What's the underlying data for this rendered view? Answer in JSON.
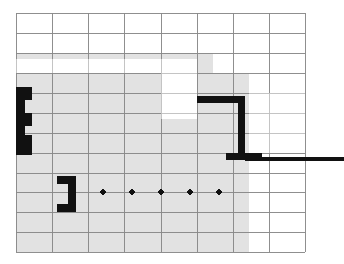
{
  "figure": {
    "name": "floor-plan-grid-diagram",
    "canvas": {
      "width": 344,
      "height": 264,
      "background": "#ffffff"
    }
  },
  "grid": {
    "name": "structural-grid",
    "origin_x": 16,
    "origin_y": 13,
    "cell_width": 36.2,
    "cell_height": 19.9,
    "columns": 8,
    "rows": 12,
    "line_color": "#8a8a8a",
    "line_width": 0.9,
    "x_lines": [
      16,
      52,
      88,
      124,
      161,
      197,
      233,
      269,
      305
    ],
    "y_lines": [
      13,
      33,
      53,
      73,
      93,
      113,
      133,
      153,
      173,
      192,
      212,
      232,
      252
    ]
  },
  "slab": {
    "name": "concrete-slab-fill",
    "fill": "#e2e2e2",
    "regions": [
      {
        "name": "slab-upper-band",
        "x": 16,
        "y": 53,
        "width": 197,
        "height": 20
      },
      {
        "name": "slab-main-body",
        "x": 16,
        "y": 73,
        "width": 233,
        "height": 179
      }
    ]
  },
  "voids": {
    "name": "floor-openings",
    "fill": "#ffffff",
    "regions": [
      {
        "name": "void-upper-left-corridor",
        "x": 16,
        "y": 59,
        "width": 181,
        "height": 14
      },
      {
        "name": "void-central-shaft",
        "x": 161,
        "y": 67,
        "width": 36,
        "height": 52
      },
      {
        "name": "void-right-bay",
        "x": 249,
        "y": 93,
        "width": 56,
        "height": 60
      }
    ]
  },
  "walls": {
    "name": "wall-elements",
    "fill": "#111111",
    "items": [
      {
        "name": "wall-left-column-cluster",
        "type": "polygon",
        "points": "16,87 32,87 32,100 25,100 25,113 32,113 32,126 25,126 25,135 32,135 32,155 16,155"
      },
      {
        "name": "wall-top-horizontal-beam",
        "type": "rect",
        "x": 197,
        "y": 96,
        "width": 48,
        "height": 7
      },
      {
        "name": "wall-vertical-pier",
        "type": "rect",
        "x": 238,
        "y": 96,
        "width": 7,
        "height": 57
      },
      {
        "name": "wall-footing-pad",
        "type": "rect",
        "x": 226,
        "y": 153,
        "width": 36,
        "height": 7
      },
      {
        "name": "wall-long-horizontal-rail",
        "type": "rect",
        "x": 245,
        "y": 157,
        "width": 99,
        "height": 4
      },
      {
        "name": "wall-lower-bracket",
        "type": "polygon",
        "points": "57,176 76,176 76,212 57,212 57,204 68,204 68,184 57,184"
      }
    ]
  },
  "dimension_dots": {
    "name": "axis-marker-dots",
    "fill": "#111111",
    "radius": 2.6,
    "cy": 192,
    "points": [
      {
        "name": "dot-1",
        "cx": 103
      },
      {
        "name": "dot-2",
        "cx": 132
      },
      {
        "name": "dot-3",
        "cx": 161
      },
      {
        "name": "dot-4",
        "cx": 190
      },
      {
        "name": "dot-5",
        "cx": 219
      }
    ]
  }
}
